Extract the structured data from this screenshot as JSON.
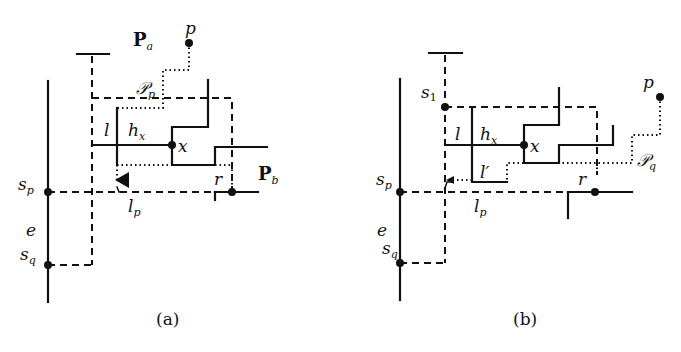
{
  "figure": {
    "panels": [
      {
        "caption": "(a)",
        "labels": {
          "P_a": "P",
          "P_a_sub": "a",
          "p": "p",
          "path": "𝒫",
          "path_sub": "p",
          "l": "l",
          "h": "h",
          "h_sub": "x",
          "x": "x",
          "P_b": "P",
          "P_b_sub": "b",
          "r": "r",
          "s_p": "s",
          "s_p_sub": "p",
          "e": "e",
          "s_q": "s",
          "s_q_sub": "q",
          "l_p": "l",
          "l_p_sub": "p"
        }
      },
      {
        "caption": "(b)",
        "labels": {
          "s_1": "s",
          "s_1_sub": "1",
          "p": "p",
          "path": "𝒫",
          "path_sub": "q",
          "l": "l",
          "l_prime": "l′",
          "h": "h",
          "h_sub": "x",
          "x": "x",
          "r": "r",
          "s_p": "s",
          "s_p_sub": "p",
          "e": "e",
          "s_q": "s",
          "s_q_sub": "q",
          "l_p": "l",
          "l_p_sub": "p"
        }
      }
    ]
  }
}
